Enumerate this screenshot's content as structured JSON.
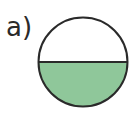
{
  "label": "a)",
  "figure": {
    "shape": "circle",
    "divided_into": 2,
    "shaded_parts": 1,
    "shaded_fraction": "1/2",
    "fill_color": "#8fc79a",
    "stroke_color": "#2a2a2a"
  }
}
